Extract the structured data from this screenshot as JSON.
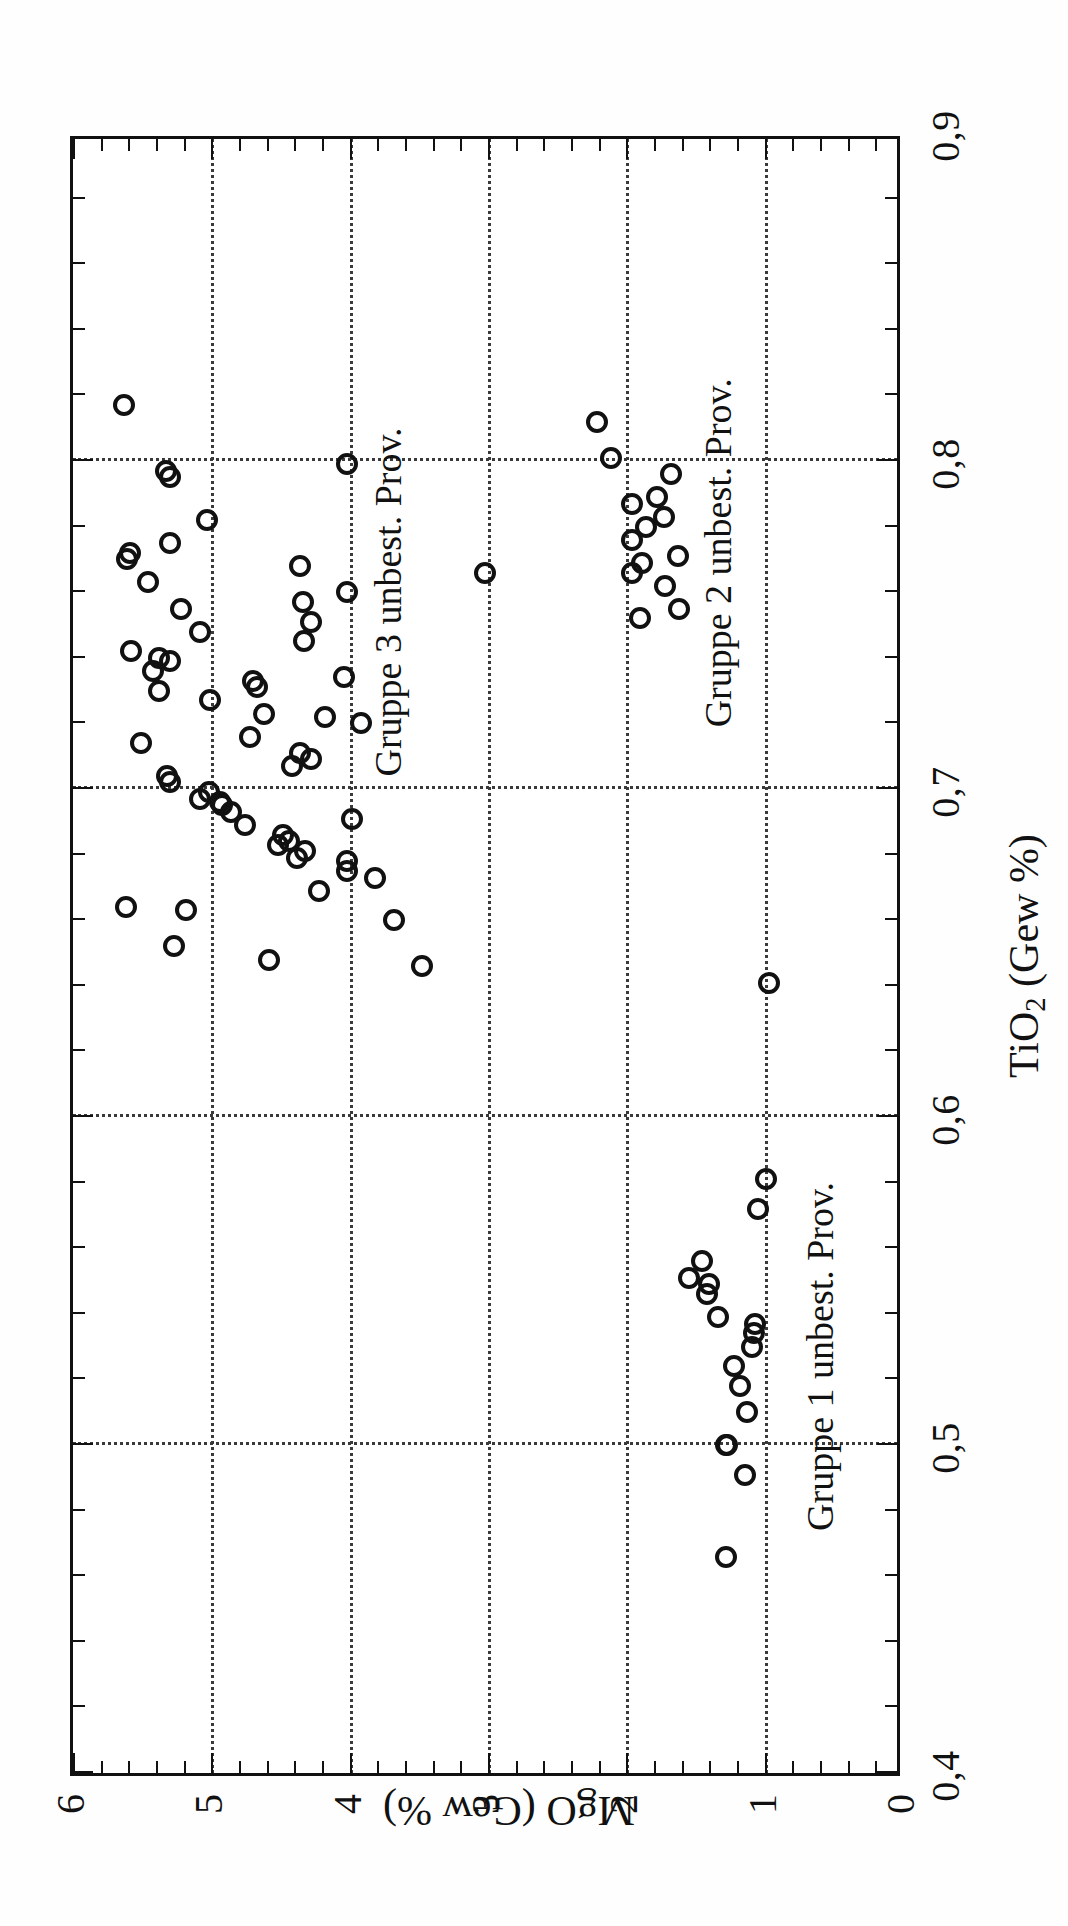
{
  "figure": {
    "background": "#ffffff",
    "ink_color": "#111111",
    "grid_color": "#3a3a3a",
    "orientation_note": "rotated-90-ccw"
  },
  "axes": {
    "x": {
      "title_html": "TiO<sub>2</sub> (Gew %)",
      "title_text": "TiO2 (Gew %)",
      "min": 0.4,
      "max": 0.9,
      "major_ticks": [
        0.4,
        0.5,
        0.6,
        0.7,
        0.8,
        0.9
      ],
      "tick_labels": [
        "0,4",
        "0,5",
        "0,6",
        "0,7",
        "0,8",
        "0,9"
      ],
      "minor_per_major": 5
    },
    "y": {
      "title_html": "MgO (Gew %)",
      "title_text": "MgO (Gew %)",
      "min": 0,
      "max": 6,
      "major_ticks": [
        0,
        1,
        2,
        3,
        4,
        5,
        6
      ],
      "tick_labels": [
        "0",
        "1",
        "2",
        "3",
        "4",
        "5",
        "6"
      ],
      "minor_per_major": 5
    }
  },
  "annotations": [
    {
      "id": "gruppe-1",
      "label": "Gruppe 1 unbest. Prov.",
      "x": 0.527,
      "y": 0.6
    },
    {
      "id": "gruppe-2",
      "label": "Gruppe 2 unbest. Prov.",
      "x": 0.772,
      "y": 1.34
    },
    {
      "id": "gruppe-3",
      "label": "Gruppe 3 unbest. Prov.",
      "x": 0.757,
      "y": 3.72
    }
  ],
  "chart_data": {
    "type": "scatter",
    "title": "",
    "xlabel": "TiO2 (Gew %)",
    "ylabel": "MgO (Gew %)",
    "xlim": [
      0.4,
      0.9
    ],
    "ylim": [
      0,
      6
    ],
    "grid": true,
    "legend": "none",
    "marker": "open-circle",
    "series": [
      {
        "name": "Gruppe 1 unbest. Prov.",
        "points": [
          [
            0.466,
            1.28
          ],
          [
            0.491,
            1.14
          ],
          [
            0.5,
            1.28
          ],
          [
            0.5,
            1.27
          ],
          [
            0.51,
            1.13
          ],
          [
            0.518,
            1.18
          ],
          [
            0.524,
            1.22
          ],
          [
            0.53,
            1.09
          ],
          [
            0.534,
            1.08
          ],
          [
            0.537,
            1.07
          ],
          [
            0.539,
            1.34
          ],
          [
            0.546,
            1.42
          ],
          [
            0.549,
            1.4
          ],
          [
            0.551,
            1.55
          ],
          [
            0.556,
            1.45
          ],
          [
            0.572,
            1.05
          ],
          [
            0.581,
            0.99
          ]
        ]
      },
      {
        "name": "Gruppe 2 unbest. Prov.",
        "points": [
          [
            0.641,
            0.97
          ],
          [
            0.752,
            1.9
          ],
          [
            0.755,
            1.62
          ],
          [
            0.762,
            1.72
          ],
          [
            0.766,
            1.96
          ],
          [
            0.769,
            1.89
          ],
          [
            0.771,
            1.63
          ],
          [
            0.776,
            1.96
          ],
          [
            0.78,
            1.86
          ],
          [
            0.783,
            1.73
          ],
          [
            0.787,
            1.96
          ],
          [
            0.789,
            1.78
          ],
          [
            0.796,
            1.68
          ],
          [
            0.801,
            2.11
          ],
          [
            0.812,
            2.21
          ]
        ]
      },
      {
        "name": "Gruppe 3 unbest. Prov.",
        "points": [
          [
            0.646,
            3.48
          ],
          [
            0.648,
            4.58
          ],
          [
            0.652,
            5.27
          ],
          [
            0.66,
            3.68
          ],
          [
            0.663,
            5.18
          ],
          [
            0.664,
            5.62
          ],
          [
            0.669,
            4.22
          ],
          [
            0.673,
            3.82
          ],
          [
            0.675,
            4.02
          ],
          [
            0.678,
            4.02
          ],
          [
            0.679,
            4.38
          ],
          [
            0.681,
            4.32
          ],
          [
            0.683,
            4.52
          ],
          [
            0.684,
            4.44
          ],
          [
            0.686,
            4.48
          ],
          [
            0.689,
            4.76
          ],
          [
            0.691,
            3.98
          ],
          [
            0.693,
            4.86
          ],
          [
            0.695,
            4.92
          ],
          [
            0.696,
            4.94
          ],
          [
            0.697,
            5.08
          ],
          [
            0.699,
            5.02
          ],
          [
            0.702,
            5.3
          ],
          [
            0.704,
            5.32
          ],
          [
            0.707,
            4.42
          ],
          [
            0.709,
            4.28
          ],
          [
            0.711,
            4.36
          ],
          [
            0.714,
            5.51
          ],
          [
            0.716,
            4.72
          ],
          [
            0.72,
            3.92
          ],
          [
            0.722,
            4.18
          ],
          [
            0.723,
            4.62
          ],
          [
            0.727,
            5.01
          ],
          [
            0.73,
            5.38
          ],
          [
            0.731,
            4.67
          ],
          [
            0.733,
            4.7
          ],
          [
            0.734,
            4.04
          ],
          [
            0.736,
            5.42
          ],
          [
            0.739,
            5.3
          ],
          [
            0.74,
            5.38
          ],
          [
            0.742,
            5.58
          ],
          [
            0.745,
            4.33
          ],
          [
            0.748,
            5.08
          ],
          [
            0.751,
            4.28
          ],
          [
            0.755,
            5.22
          ],
          [
            0.757,
            4.34
          ],
          [
            0.76,
            4.02
          ],
          [
            0.763,
            5.46
          ],
          [
            0.766,
            3.02
          ],
          [
            0.768,
            4.36
          ],
          [
            0.77,
            5.61
          ],
          [
            0.772,
            5.59
          ],
          [
            0.775,
            5.3
          ],
          [
            0.782,
            5.03
          ],
          [
            0.795,
            5.3
          ],
          [
            0.797,
            5.33
          ],
          [
            0.799,
            4.02
          ],
          [
            0.817,
            5.63
          ]
        ]
      }
    ]
  }
}
